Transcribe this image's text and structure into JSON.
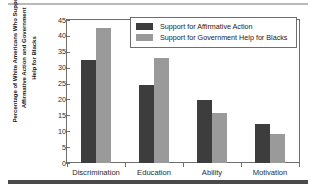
{
  "chart_data": {
    "type": "bar",
    "title": "",
    "xlabel": "",
    "ylabel": "Percentage of White Americans Who Support Affirmative Action and Government Help for Blacks",
    "ylabel_lines": [
      "Percentage of White Americans Who Support",
      "Affirmative Action and Government",
      "Help for Blacks"
    ],
    "categories": [
      "Discrimination",
      "Education",
      "Ability",
      "Motivation"
    ],
    "series": [
      {
        "name": "Support for Affirmative Action",
        "color": "#3d3d3d",
        "values": [
          32.5,
          24.7,
          19.9,
          12.4
        ]
      },
      {
        "name": "Support for Government Help for Blacks",
        "color": "#9a9a9a",
        "values": [
          42.5,
          33.2,
          15.7,
          9.2
        ]
      }
    ],
    "ylim": [
      0,
      45
    ],
    "ytick_values": [
      0,
      5,
      10,
      15,
      20,
      25,
      30,
      35,
      40,
      45
    ],
    "ytick_labels": [
      "0",
      "5",
      "10",
      "15",
      "20",
      "25",
      "30",
      "35",
      "40",
      "45"
    ],
    "grid": false,
    "legend_position": "top-right"
  },
  "legend": {
    "entries": [
      {
        "label": "Support for Affirmative Action",
        "color": "#3d3d3d"
      },
      {
        "label": "Support for Government Help for Blacks",
        "color": "#9a9a9a"
      }
    ]
  },
  "colors": {
    "series_dark": "#3d3d3d",
    "series_light": "#9a9a9a",
    "axis": "#6e6e6e",
    "top_rule": "#b9b9b9",
    "bottom_rule": "#4a4a4a",
    "text": "#1a1a1a"
  }
}
